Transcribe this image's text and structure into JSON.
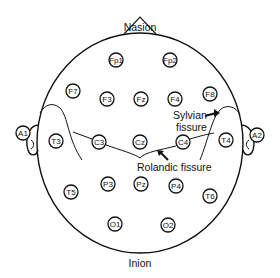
{
  "diagram": {
    "type": "EEG 10-20 electrode placement (top view of head)",
    "stroke_color": "#111111",
    "background": "#ffffff",
    "landmarks": {
      "nasion": "Nasion",
      "inion": "Inion"
    },
    "annotations": {
      "sylvian_line1": "Sylvian",
      "sylvian_line2": "fissure",
      "rolandic": "Rolandic fissure"
    },
    "electrodes": [
      {
        "id": "Fp1",
        "label": "Fp1",
        "x": 116,
        "y": 60
      },
      {
        "id": "Fp2",
        "label": "Fp2",
        "x": 170,
        "y": 60
      },
      {
        "id": "F7",
        "label": "F7",
        "x": 73,
        "y": 91
      },
      {
        "id": "F3",
        "label": "F3",
        "x": 107,
        "y": 99
      },
      {
        "id": "Fz",
        "label": "Fz",
        "x": 141,
        "y": 99
      },
      {
        "id": "F4",
        "label": "F4",
        "x": 175,
        "y": 99
      },
      {
        "id": "F8",
        "label": "F8",
        "x": 210,
        "y": 94
      },
      {
        "id": "A1",
        "label": "A1",
        "x": 23,
        "y": 133
      },
      {
        "id": "T3",
        "label": "T3",
        "x": 56,
        "y": 141
      },
      {
        "id": "C3",
        "label": "C3",
        "x": 99,
        "y": 142
      },
      {
        "id": "Cz",
        "label": "Cz",
        "x": 140,
        "y": 142
      },
      {
        "id": "C4",
        "label": "C4",
        "x": 183,
        "y": 142
      },
      {
        "id": "T4",
        "label": "T4",
        "x": 226,
        "y": 140
      },
      {
        "id": "A2",
        "label": "A2",
        "x": 257,
        "y": 135
      },
      {
        "id": "T5",
        "label": "T5",
        "x": 71,
        "y": 192
      },
      {
        "id": "P3",
        "label": "P3",
        "x": 108,
        "y": 184
      },
      {
        "id": "Pz",
        "label": "Pz",
        "x": 141,
        "y": 184
      },
      {
        "id": "P4",
        "label": "P4",
        "x": 176,
        "y": 186
      },
      {
        "id": "T6",
        "label": "T6",
        "x": 210,
        "y": 196
      },
      {
        "id": "O1",
        "label": "O1",
        "x": 115,
        "y": 224
      },
      {
        "id": "O2",
        "label": "O2",
        "x": 168,
        "y": 225
      }
    ]
  }
}
